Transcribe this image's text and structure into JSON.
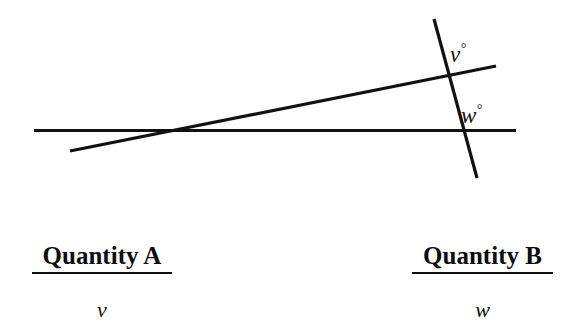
{
  "figure": {
    "background_color": "#ffffff",
    "stroke_color": "#111111",
    "lines": [
      {
        "name": "horizontal-line",
        "x1": 34,
        "y1": 130.5,
        "x2": 516,
        "y2": 130.5,
        "stroke_width": 3.2
      },
      {
        "name": "transversal-line",
        "x1": 70,
        "y1": 151,
        "x2": 496,
        "y2": 66,
        "stroke_width": 3.2
      },
      {
        "name": "steep-line",
        "x1": 434,
        "y1": 19,
        "x2": 477,
        "y2": 178,
        "stroke_width": 3.2
      }
    ],
    "intersections": [
      {
        "name": "horizontal-transversal",
        "x": 172,
        "y": 130
      },
      {
        "name": "transversal-steep",
        "x": 448,
        "y": 76
      },
      {
        "name": "horizontal-steep",
        "x": 462,
        "y": 131
      }
    ],
    "angle_labels": {
      "v": {
        "variable": "v",
        "degree_symbol": "°"
      },
      "w": {
        "variable": "w",
        "degree_symbol": "°"
      }
    }
  },
  "comparison": {
    "columns": [
      {
        "heading": "Quantity A",
        "value": "v"
      },
      {
        "heading": "Quantity B",
        "value": "w"
      }
    ]
  }
}
